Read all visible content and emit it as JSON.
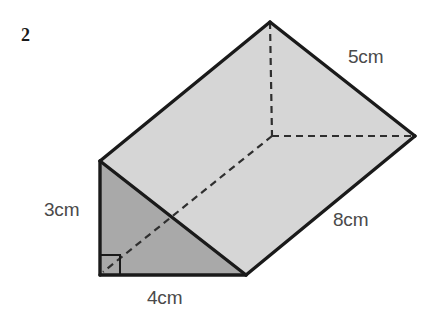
{
  "page": {
    "question_number": "2",
    "background_color": "#ffffff"
  },
  "figure": {
    "name": "triangular-prism",
    "colors": {
      "outline": "#1a1a1a",
      "top_slant_face": "#d6d6d6",
      "front_triangle_face": "#a9a9a9",
      "back_right_face": "#9a9a9a",
      "bottom_face": "#b4b4b4",
      "hidden_edge": "#2b2b2b",
      "label_text": "#4a4a4a",
      "question_number_text": "#1a1a1a"
    },
    "vertices": {
      "front_apex": [
        100,
        161
      ],
      "front_bottom_left": [
        100,
        275
      ],
      "front_bottom_right": [
        246,
        275
      ],
      "back_apex": [
        270,
        22
      ],
      "back_bottom_left_hidden": [
        272,
        136
      ],
      "back_bottom_right": [
        415,
        136
      ]
    },
    "right_angle_marker": {
      "at_vertex": "front_bottom_left",
      "size_px": 20
    },
    "hidden_edges": [
      [
        "back_apex",
        "back_bottom_left_hidden"
      ],
      [
        "back_bottom_left_hidden",
        "back_bottom_right"
      ],
      [
        "back_bottom_left_hidden",
        "front_bottom_left"
      ]
    ]
  },
  "labels": {
    "height": "3cm",
    "base": "4cm",
    "hypotenuse": "5cm",
    "length": "8cm"
  }
}
